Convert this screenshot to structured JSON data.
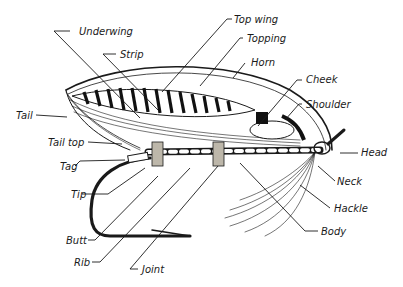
{
  "diagram": {
    "ink_color": "#1a1a1a",
    "labels": [
      {
        "id": "underwing",
        "text": "Underwing",
        "x": 79,
        "y": 26
      },
      {
        "id": "strip",
        "text": "Strip",
        "x": 120,
        "y": 49
      },
      {
        "id": "top-wing",
        "text": "Top wing",
        "x": 234,
        "y": 14
      },
      {
        "id": "topping",
        "text": "Topping",
        "x": 247,
        "y": 33
      },
      {
        "id": "horn",
        "text": "Horn",
        "x": 251,
        "y": 57
      },
      {
        "id": "cheek",
        "text": "Cheek",
        "x": 306,
        "y": 74
      },
      {
        "id": "shoulder",
        "text": "Shoulder",
        "x": 306,
        "y": 99
      },
      {
        "id": "tail",
        "text": "Tail",
        "x": 16,
        "y": 110
      },
      {
        "id": "tail-top",
        "text": "Tail top",
        "x": 48,
        "y": 137
      },
      {
        "id": "tag",
        "text": "Tag",
        "x": 60,
        "y": 161
      },
      {
        "id": "tip",
        "text": "Tip",
        "x": 71,
        "y": 189
      },
      {
        "id": "head",
        "text": "Head",
        "x": 361,
        "y": 147
      },
      {
        "id": "neck",
        "text": "Neck",
        "x": 337,
        "y": 176
      },
      {
        "id": "hackle",
        "text": "Hackle",
        "x": 334,
        "y": 203
      },
      {
        "id": "body",
        "text": "Body",
        "x": 321,
        "y": 226
      },
      {
        "id": "butt",
        "text": "Butt",
        "x": 66,
        "y": 235
      },
      {
        "id": "rib",
        "text": "Rib",
        "x": 74,
        "y": 257
      },
      {
        "id": "joint",
        "text": "Joint",
        "x": 142,
        "y": 264
      }
    ]
  }
}
